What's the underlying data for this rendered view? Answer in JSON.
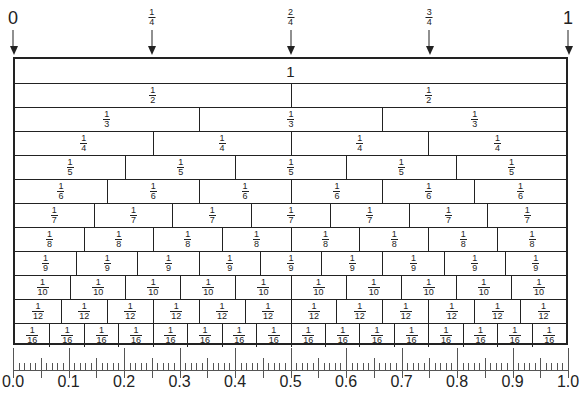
{
  "top_markers": [
    {
      "label": "0",
      "pos": 0,
      "big": true
    },
    {
      "label_n": "1",
      "label_d": "4",
      "pos": 0.25
    },
    {
      "label_n": "2",
      "label_d": "4",
      "pos": 0.5
    },
    {
      "label_n": "3",
      "label_d": "4",
      "pos": 0.75
    },
    {
      "label": "1",
      "pos": 1,
      "big": true
    }
  ],
  "wall": {
    "whole_label": "1",
    "rows": [
      {
        "denominator": 1,
        "numerator": "1"
      },
      {
        "denominator": 2,
        "numerator": "1"
      },
      {
        "denominator": 3,
        "numerator": "1"
      },
      {
        "denominator": 4,
        "numerator": "1"
      },
      {
        "denominator": 5,
        "numerator": "1"
      },
      {
        "denominator": 6,
        "numerator": "1"
      },
      {
        "denominator": 7,
        "numerator": "1"
      },
      {
        "denominator": 8,
        "numerator": "1"
      },
      {
        "denominator": 9,
        "numerator": "1"
      },
      {
        "denominator": 10,
        "numerator": "1"
      },
      {
        "denominator": 12,
        "numerator": "1"
      },
      {
        "denominator": 16,
        "numerator": "1"
      }
    ]
  },
  "ruler": {
    "labels": [
      "0.0",
      "0.1",
      "0.2",
      "0.3",
      "0.4",
      "0.5",
      "0.6",
      "0.7",
      "0.8",
      "0.9",
      "1.0"
    ],
    "minor_divisions": 100
  }
}
